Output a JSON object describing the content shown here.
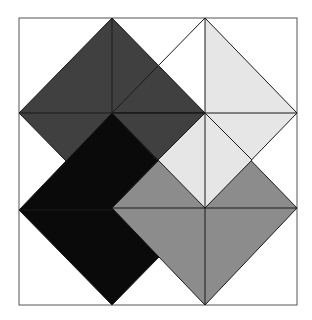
{
  "diagram": {
    "title": "",
    "frame": {
      "x": 19,
      "y": 18,
      "w": 278,
      "h": 287,
      "stroke": "#555555"
    },
    "colors": {
      "dark": "#404040",
      "light": "#e6e6e6",
      "black": "#0a0a0a",
      "gray": "#8c8c8c",
      "line": "#1a1a1a"
    },
    "shapes": [
      {
        "name": "dark-diamond",
        "fill": "#404040",
        "points": "112,18 205,113 112,208 19,113",
        "center": [
          112,
          113
        ]
      },
      {
        "name": "light-diamond",
        "fill": "#e6e6e6",
        "points": "205,18 297,113 205,208 112,113",
        "center": [
          205,
          113
        ]
      },
      {
        "name": "black-diamond",
        "fill": "#0a0a0a",
        "points": "112,113 205,210 112,305 19,210",
        "center": [
          112,
          210
        ]
      },
      {
        "name": "gray-diamond",
        "fill": "#8c8c8c",
        "points": "205,113 297,208 205,305 112,208",
        "center": [
          205,
          208
        ]
      }
    ]
  }
}
